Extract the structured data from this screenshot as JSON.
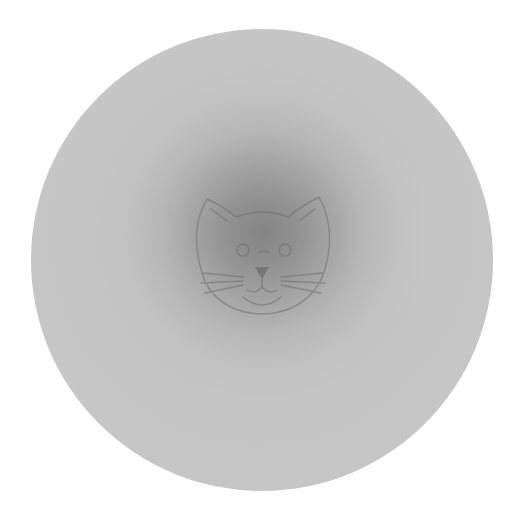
{
  "image": {
    "description": "Gray circular vignette with a faint line-drawn cat face at the darker center",
    "background_color": "#ffffff",
    "disc_color": "#c6c6c6",
    "center_shadow_color": "#858585",
    "line_color": "#7a7a7a",
    "subject": "cat-face"
  }
}
